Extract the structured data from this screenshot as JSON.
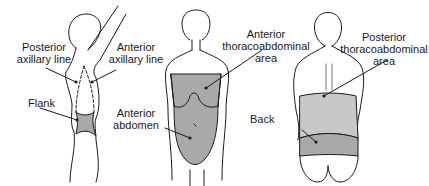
{
  "figure": {
    "panels": [
      {
        "id": "lateral",
        "view": "lateral",
        "labels": [
          {
            "key": "posterior_axillary_line",
            "lines": [
              "Posterior",
              "axillary line"
            ]
          },
          {
            "key": "anterior_axillary_line",
            "lines": [
              "Anterior",
              "axillary line"
            ]
          },
          {
            "key": "flank",
            "lines": [
              "Flank"
            ]
          }
        ]
      },
      {
        "id": "anterior",
        "view": "anterior",
        "labels": [
          {
            "key": "anterior_thoracoabdominal_area",
            "lines": [
              "Anterior",
              "thoracoabdominal",
              "area"
            ]
          },
          {
            "key": "anterior_abdomen",
            "lines": [
              "Anterior",
              "abdomen"
            ]
          }
        ]
      },
      {
        "id": "posterior",
        "view": "posterior",
        "labels": [
          {
            "key": "posterior_thoracoabdominal_area",
            "lines": [
              "Posterior",
              "thoracoabdominal",
              "area"
            ]
          },
          {
            "key": "back",
            "lines": [
              "Back"
            ]
          }
        ]
      }
    ],
    "colors": {
      "outline": "#1a1a1a",
      "shade_dark": "#a9a9a9",
      "shade_light": "#c8c8c8",
      "background": "#ffffff"
    }
  }
}
